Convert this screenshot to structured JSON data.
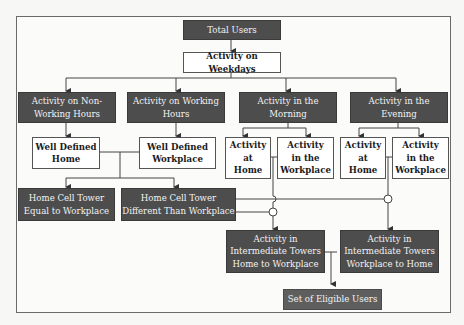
{
  "diagram": {
    "nodes": {
      "total_users": "Total Users",
      "weekdays": "Activity on Weekdays",
      "non_working": "Activity on Non-\nWorking Hours",
      "working": "Activity on Working\nHours",
      "morning": "Activity in the\nMorning",
      "evening": "Activity in the\nEvening",
      "home": "Well Defined\nHome",
      "workplace": "Well Defined\nWorkplace",
      "morning_home": "Activity\nat\nHome",
      "morning_work": "Activity\nin the\nWorkplace",
      "evening_home": "Activity\nat\nHome",
      "evening_work": "Activity\nin the\nWorkplace",
      "tower_equal": "Home Cell Tower\nEqual to Workplace",
      "tower_diff": "Home Cell Tower\nDifferent Than Workplace",
      "inter_h2w": "Activity in\nIntermediate Towers\nHome to Workplace",
      "inter_w2h": "Activity in\nIntermediate Towers\nWorkplace to Home",
      "eligible": "Set of Eligible Users"
    },
    "colors": {
      "dark_box": "#4d4d4d",
      "light_box": "#ffffff",
      "line": "#444444"
    }
  }
}
